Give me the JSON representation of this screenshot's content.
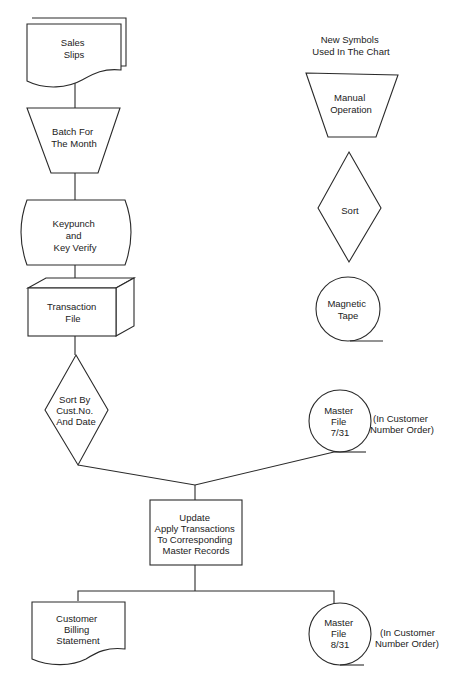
{
  "legend": {
    "title": [
      "New Symbols",
      "Used In The Chart"
    ],
    "items": [
      {
        "symbol": "manual-operation",
        "label": [
          "Manual",
          "Operation"
        ]
      },
      {
        "symbol": "sort",
        "label": [
          "Sort"
        ]
      },
      {
        "symbol": "magnetic-tape",
        "label": [
          "Magnetic",
          "Tape"
        ]
      }
    ]
  },
  "flow": {
    "sales_slips": {
      "symbol": "multi-document",
      "label": [
        "Sales",
        "Slips"
      ]
    },
    "batch": {
      "symbol": "manual-operation",
      "label": [
        "Batch For",
        "The Month"
      ]
    },
    "keypunch": {
      "symbol": "offline-keyboard",
      "label": [
        "Keypunch",
        "and",
        "Key Verify"
      ]
    },
    "transaction_file": {
      "symbol": "offline-storage",
      "label": [
        "Transaction",
        "File"
      ]
    },
    "sort": {
      "symbol": "sort",
      "label": [
        "Sort By",
        "Cust.No.",
        "And Date"
      ]
    },
    "master_in": {
      "symbol": "magnetic-tape",
      "label": [
        "Master",
        "File",
        "7/31"
      ],
      "note": [
        "(In Customer",
        "Number Order)"
      ]
    },
    "update": {
      "symbol": "process",
      "label": [
        "Update",
        "Apply Transactions",
        "To Corresponding",
        "Master Records"
      ]
    },
    "billing": {
      "symbol": "document",
      "label": [
        "Customer",
        "Billing",
        "Statement"
      ]
    },
    "master_out": {
      "symbol": "magnetic-tape",
      "label": [
        "Master",
        "File",
        "8/31"
      ],
      "note": [
        "(In Customer",
        "Number Order)"
      ]
    }
  },
  "colors": {
    "stroke": "#2a2a2a",
    "text": "#222222",
    "background": "#ffffff"
  }
}
